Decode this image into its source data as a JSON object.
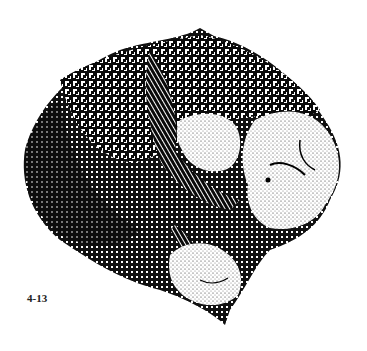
{
  "figure": {
    "label": "4-13",
    "ink_color": "#0a0a0a",
    "paper_color": "#ffffff"
  }
}
